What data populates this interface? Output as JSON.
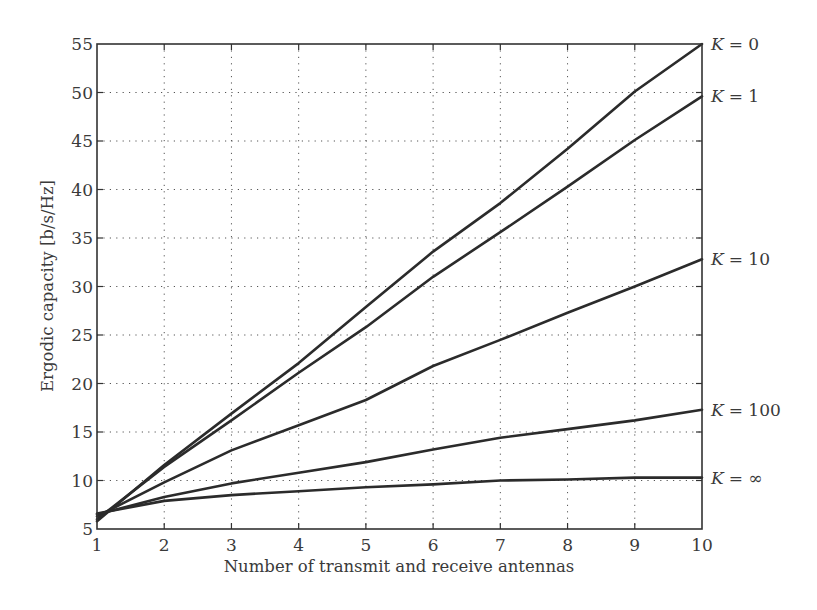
{
  "chart_data": {
    "type": "line",
    "title": "",
    "xlabel": "Number of transmit and receive antennas",
    "ylabel": "Ergodic capacity [b/s/Hz]",
    "xlim": [
      1,
      10
    ],
    "ylim": [
      5,
      55
    ],
    "xticks": [
      1,
      2,
      3,
      4,
      5,
      6,
      7,
      8,
      9,
      10
    ],
    "yticks": [
      5,
      10,
      15,
      20,
      25,
      30,
      35,
      40,
      45,
      50,
      55
    ],
    "grid": true,
    "grid_style": "dotted",
    "legend_position": "inline-right",
    "x": [
      1,
      2,
      3,
      4,
      5,
      6,
      7,
      8,
      9,
      10
    ],
    "series": [
      {
        "name": "K = 0",
        "var": "K",
        "value_label": "= 0",
        "values": [
          5.8,
          11.6,
          16.9,
          22.1,
          27.9,
          33.6,
          38.6,
          44.2,
          50.1,
          55.0
        ]
      },
      {
        "name": "K = 1",
        "var": "K",
        "value_label": "= 1",
        "values": [
          6.0,
          11.4,
          16.2,
          21.1,
          25.8,
          31.0,
          35.6,
          40.3,
          45.1,
          49.6
        ]
      },
      {
        "name": "K = 10",
        "var": "K",
        "value_label": "= 10",
        "values": [
          6.3,
          9.8,
          13.1,
          15.7,
          18.3,
          21.8,
          24.5,
          27.3,
          30.0,
          32.8
        ]
      },
      {
        "name": "K = 100",
        "var": "K",
        "value_label": "= 100",
        "values": [
          6.5,
          8.3,
          9.7,
          10.8,
          11.9,
          13.2,
          14.4,
          15.3,
          16.2,
          17.3
        ]
      },
      {
        "name": "K = ∞",
        "var": "K",
        "value_label": "= ∞",
        "values": [
          6.6,
          7.9,
          8.5,
          8.9,
          9.3,
          9.6,
          10.0,
          10.1,
          10.3,
          10.3
        ]
      }
    ]
  },
  "colors": {
    "line": "#2b2b2b",
    "text": "#3a3a3a",
    "grid": "#555555",
    "background": "#ffffff"
  }
}
